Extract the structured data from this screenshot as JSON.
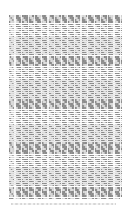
{
  "page": {
    "kind": "document-page-thumbnail",
    "width": 131,
    "height": 216,
    "background_color": "#ffffff",
    "description": "Single page of dense justified body text rendered at thumbnail scale; individual glyphs are not resolvable and read as horizontal gray striping."
  },
  "text_block": {
    "label": "Body text block",
    "left": 9,
    "top": 15,
    "width": 113,
    "height": 185,
    "line_count": 90,
    "line_height_px": 2.05,
    "alignment": "justified",
    "columns": 1,
    "ink_color": "#888888",
    "lead_color": "#e9e9e9",
    "lines": [
      {
        "indent": 0,
        "fill": 100
      },
      {
        "indent": 0,
        "fill": 100
      },
      {
        "indent": 0,
        "fill": 100
      },
      {
        "indent": 0,
        "fill": 100
      },
      {
        "indent": 0,
        "fill": 100
      },
      {
        "indent": 0,
        "fill": 100
      },
      {
        "indent": 0,
        "fill": 100
      },
      {
        "indent": 0,
        "fill": 100
      },
      {
        "indent": 0,
        "fill": 100
      },
      {
        "indent": 0,
        "fill": 100
      },
      {
        "indent": 0,
        "fill": 100
      },
      {
        "indent": 0,
        "fill": 100
      },
      {
        "indent": 0,
        "fill": 100
      },
      {
        "indent": 0,
        "fill": 100
      },
      {
        "indent": 0,
        "fill": 100
      },
      {
        "indent": 0,
        "fill": 100
      },
      {
        "indent": 0,
        "fill": 100
      },
      {
        "indent": 0,
        "fill": 100
      },
      {
        "indent": 0,
        "fill": 100
      },
      {
        "indent": 0,
        "fill": 100
      },
      {
        "indent": 0,
        "fill": 100
      },
      {
        "indent": 0,
        "fill": 100
      },
      {
        "indent": 0,
        "fill": 100
      },
      {
        "indent": 0,
        "fill": 100
      },
      {
        "indent": 0,
        "fill": 100
      },
      {
        "indent": 0,
        "fill": 100
      },
      {
        "indent": 0,
        "fill": 100
      },
      {
        "indent": 0,
        "fill": 100
      },
      {
        "indent": 0,
        "fill": 100
      },
      {
        "indent": 0,
        "fill": 100
      },
      {
        "indent": 0,
        "fill": 100
      },
      {
        "indent": 0,
        "fill": 100
      },
      {
        "indent": 0,
        "fill": 100
      },
      {
        "indent": 0,
        "fill": 100
      },
      {
        "indent": 0,
        "fill": 100
      },
      {
        "indent": 0,
        "fill": 100
      },
      {
        "indent": 0,
        "fill": 100
      },
      {
        "indent": 0,
        "fill": 100
      },
      {
        "indent": 0,
        "fill": 100
      },
      {
        "indent": 0,
        "fill": 100
      },
      {
        "indent": 0,
        "fill": 100
      },
      {
        "indent": 0,
        "fill": 100
      },
      {
        "indent": 0,
        "fill": 100
      },
      {
        "indent": 0,
        "fill": 100
      },
      {
        "indent": 0,
        "fill": 100
      },
      {
        "indent": 0,
        "fill": 100
      },
      {
        "indent": 0,
        "fill": 100
      },
      {
        "indent": 0,
        "fill": 100
      },
      {
        "indent": 0,
        "fill": 100
      },
      {
        "indent": 0,
        "fill": 100
      },
      {
        "indent": 0,
        "fill": 100
      },
      {
        "indent": 0,
        "fill": 100
      },
      {
        "indent": 0,
        "fill": 100
      },
      {
        "indent": 0,
        "fill": 100
      },
      {
        "indent": 0,
        "fill": 100
      },
      {
        "indent": 0,
        "fill": 100
      },
      {
        "indent": 0,
        "fill": 100
      },
      {
        "indent": 0,
        "fill": 100
      },
      {
        "indent": 0,
        "fill": 100
      },
      {
        "indent": 0,
        "fill": 100
      },
      {
        "indent": 0,
        "fill": 100
      },
      {
        "indent": 0,
        "fill": 100
      },
      {
        "indent": 0,
        "fill": 100
      },
      {
        "indent": 0,
        "fill": 100
      },
      {
        "indent": 0,
        "fill": 100
      },
      {
        "indent": 0,
        "fill": 100
      },
      {
        "indent": 0,
        "fill": 100
      },
      {
        "indent": 0,
        "fill": 100
      },
      {
        "indent": 0,
        "fill": 100
      },
      {
        "indent": 0,
        "fill": 100
      },
      {
        "indent": 0,
        "fill": 100
      },
      {
        "indent": 0,
        "fill": 100
      },
      {
        "indent": 0,
        "fill": 100
      },
      {
        "indent": 0,
        "fill": 100
      },
      {
        "indent": 0,
        "fill": 100
      },
      {
        "indent": 0,
        "fill": 100
      },
      {
        "indent": 0,
        "fill": 100
      },
      {
        "indent": 0,
        "fill": 100
      },
      {
        "indent": 0,
        "fill": 100
      },
      {
        "indent": 0,
        "fill": 100
      },
      {
        "indent": 0,
        "fill": 100
      },
      {
        "indent": 0,
        "fill": 100
      },
      {
        "indent": 0,
        "fill": 100
      },
      {
        "indent": 0,
        "fill": 100
      },
      {
        "indent": 0,
        "fill": 100
      },
      {
        "indent": 0,
        "fill": 100
      },
      {
        "indent": 0,
        "fill": 100
      },
      {
        "indent": 0,
        "fill": 100
      },
      {
        "indent": 0,
        "fill": 100
      },
      {
        "indent": 0,
        "fill": 98
      }
    ]
  },
  "footer": {
    "label": "Footer line",
    "left": 11,
    "top": 203,
    "width": 105,
    "height": 2,
    "ink_color": "#cccccc",
    "visible": true
  },
  "margins": {
    "top": 15,
    "bottom": 11,
    "left": 9,
    "right": 9
  }
}
